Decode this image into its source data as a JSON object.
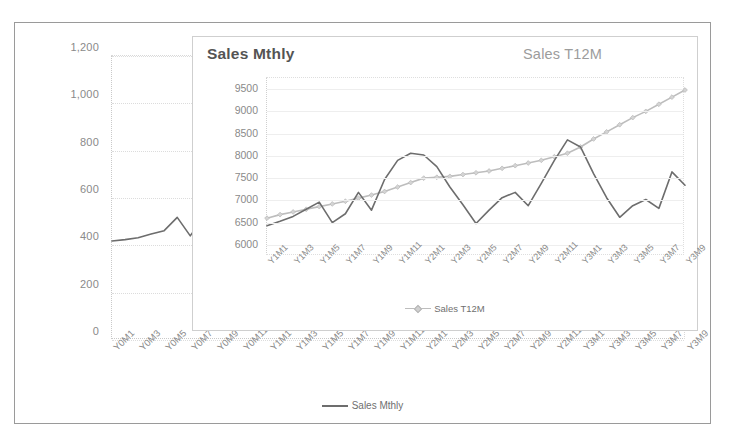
{
  "chart_data": [
    {
      "id": "outer",
      "type": "line",
      "title": "",
      "xlabel": "",
      "ylabel": "",
      "ylim": [
        0,
        1200
      ],
      "yticks": [
        0,
        200,
        400,
        600,
        800,
        1000,
        1200
      ],
      "ytick_labels": [
        "0",
        "200",
        "400",
        "600",
        "800",
        "1,000",
        "1,200"
      ],
      "grid": true,
      "legend_position": "bottom-center",
      "legend": [
        "Sales Mthly"
      ],
      "line_color": "#6d6d6d",
      "categories": [
        "Y0M1",
        "Y0M2",
        "Y0M3",
        "Y0M4",
        "Y0M5",
        "Y0M6",
        "Y0M7",
        "Y0M8",
        "Y0M9",
        "Y0M10",
        "Y0M11",
        "Y0M12",
        "Y1M1",
        "Y1M2",
        "Y1M3",
        "Y1M4",
        "Y1M5",
        "Y1M6",
        "Y1M7",
        "Y1M8",
        "Y1M9",
        "Y1M10",
        "Y1M11",
        "Y1M12",
        "Y2M1",
        "Y2M2",
        "Y2M3",
        "Y2M4",
        "Y2M5",
        "Y2M6",
        "Y2M7",
        "Y2M8",
        "Y2M9",
        "Y2M10",
        "Y2M11",
        "Y2M12",
        "Y3M1",
        "Y3M2",
        "Y3M3",
        "Y3M4",
        "Y3M5",
        "Y3M6",
        "Y3M7",
        "Y3M8",
        "Y3M9"
      ],
      "xtick_labels": [
        "Y0M1",
        "Y0M3",
        "Y0M5",
        "Y0M7",
        "Y0M9",
        "Y0M11",
        "Y1M1",
        "Y1M3",
        "Y1M5",
        "Y1M7",
        "Y1M9",
        "Y1M11",
        "Y2M1",
        "Y2M3",
        "Y2M5",
        "Y2M7",
        "Y2M9",
        "Y2M11",
        "Y3M1",
        "Y3M3",
        "Y3M5",
        "Y3M7",
        "Y3M9"
      ],
      "series": [
        {
          "name": "Sales Mthly",
          "values": [
            418,
            424,
            432,
            448,
            462,
            518,
            440,
            520,
            600,
            505,
            560,
            640,
            690,
            702,
            700,
            672,
            630,
            596,
            558,
            576,
            620,
            570,
            600,
            660,
            700,
            760,
            812,
            806,
            760,
            690,
            600,
            536,
            476,
            540,
            600,
            580,
            620,
            700,
            660,
            760,
            840,
            880,
            930,
            860,
            1070
          ]
        }
      ]
    },
    {
      "id": "inner",
      "type": "line",
      "title": "Sales Mthly",
      "title_right": "Sales T12M",
      "xlabel": "",
      "ylabel": "",
      "ylim": [
        5750,
        9750
      ],
      "yticks": [
        6000,
        6500,
        7000,
        7500,
        8000,
        8500,
        9000,
        9500
      ],
      "ytick_labels": [
        "6000",
        "6500",
        "7000",
        "7500",
        "8000",
        "8500",
        "9000",
        "9500"
      ],
      "grid": true,
      "legend_position": "bottom-center",
      "legend": [
        "Sales T12M"
      ],
      "mthly_color": "#6d6d6d",
      "t12m_color": "#bdbdbd",
      "categories": [
        "Y1M1",
        "Y1M2",
        "Y1M3",
        "Y1M4",
        "Y1M5",
        "Y1M6",
        "Y1M7",
        "Y1M8",
        "Y1M9",
        "Y1M10",
        "Y1M11",
        "Y1M12",
        "Y2M1",
        "Y2M2",
        "Y2M3",
        "Y2M4",
        "Y2M5",
        "Y2M6",
        "Y2M7",
        "Y2M8",
        "Y2M9",
        "Y2M10",
        "Y2M11",
        "Y2M12",
        "Y3M1",
        "Y3M2",
        "Y3M3",
        "Y3M4",
        "Y3M5",
        "Y3M6",
        "Y3M7",
        "Y3M8",
        "Y3M9"
      ],
      "xtick_labels": [
        "Y1M1",
        "Y1M3",
        "Y1M5",
        "Y1M7",
        "Y1M9",
        "Y1M11",
        "Y2M1",
        "Y2M3",
        "Y2M5",
        "Y2M7",
        "Y2M9",
        "Y2M11",
        "Y3M1",
        "Y3M3",
        "Y3M5",
        "Y3M7",
        "Y3M9"
      ],
      "series": [
        {
          "name": "Sales Mthly",
          "values": [
            6430,
            6530,
            6640,
            6800,
            6960,
            6500,
            6700,
            7180,
            6780,
            7470,
            7900,
            8060,
            8020,
            7760,
            7300,
            6900,
            6480,
            6780,
            7060,
            7180,
            6880,
            7380,
            7900,
            8360,
            8200,
            7600,
            7060,
            6620,
            6880,
            7020,
            6820,
            7640,
            7340
          ]
        },
        {
          "name": "Sales T12M",
          "values": [
            6600,
            6680,
            6740,
            6800,
            6860,
            6920,
            6980,
            7050,
            7120,
            7200,
            7300,
            7400,
            7500,
            7520,
            7540,
            7580,
            7620,
            7660,
            7720,
            7780,
            7840,
            7900,
            7980,
            8060,
            8200,
            8380,
            8540,
            8700,
            8860,
            9000,
            9160,
            9320,
            9480
          ]
        }
      ]
    }
  ]
}
